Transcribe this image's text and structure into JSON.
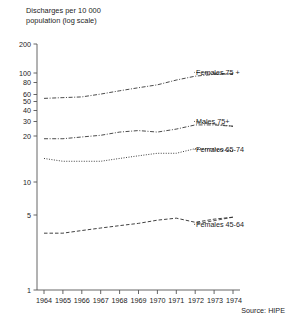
{
  "chart_data": {
    "type": "line",
    "title_line1": "Discharges per 10 000",
    "title_line2": "population (log scale)",
    "xlabel": "",
    "ylabel": "Discharges per 10 000 population (log scale)",
    "yscale": "log",
    "ylim": [
      1,
      200
    ],
    "xlim": [
      1964,
      1974
    ],
    "grid": false,
    "legend_position": "right-inline-labels",
    "source": "Source: HIPE",
    "ytick_labels": [
      "200",
      "100",
      "80",
      "60",
      "50",
      "40",
      "30",
      "20",
      "10",
      "5",
      "1"
    ],
    "ytick_values": [
      200,
      100,
      80,
      60,
      50,
      40,
      30,
      20,
      10,
      5,
      1
    ],
    "categories": [
      "1964",
      "1965",
      "1966",
      "1967",
      "1968",
      "1969",
      "1970",
      "1971",
      "1972",
      "1973",
      "1974"
    ],
    "x": [
      1964,
      1965,
      1966,
      1967,
      1968,
      1969,
      1970,
      1971,
      1972,
      1973,
      1974
    ],
    "series": [
      {
        "name": "Females 75 +",
        "style": "dash-dot",
        "values": [
          62,
          63,
          64,
          68,
          73,
          78,
          83,
          92,
          100,
          104,
          105
        ]
      },
      {
        "name": "Males 75+",
        "style": "dash-dot",
        "values": [
          26,
          26,
          27,
          28,
          30,
          31,
          30,
          32,
          35,
          35,
          34
        ]
      },
      {
        "name": "Females 65-74",
        "style": "dotted",
        "values": [
          17,
          16,
          16,
          16,
          17,
          18,
          19,
          19,
          21,
          21,
          20
        ]
      },
      {
        "name": "Females 45-64",
        "style": "dashed",
        "values": [
          3.4,
          3.4,
          3.6,
          3.8,
          4.0,
          4.2,
          4.5,
          4.7,
          4.3,
          4.6,
          4.8
        ]
      }
    ]
  },
  "labels": {
    "series_0": "Females 75 +",
    "series_1": "Males 75+",
    "series_2": "Females 65-74",
    "series_3": "Females 45-64"
  },
  "ytick": {
    "t0": "200",
    "t1": "100",
    "t2": "80",
    "t3": "60",
    "t4": "50",
    "t5": "40",
    "t6": "30",
    "t7": "20",
    "t8": "10",
    "t9": "5",
    "t10": "1"
  },
  "xtick": {
    "t0": "1964",
    "t1": "1965",
    "t2": "1966",
    "t3": "1967",
    "t4": "1968",
    "t5": "1969",
    "t6": "1970",
    "t7": "1971",
    "t8": "1972",
    "t9": "1973",
    "t10": "1974"
  },
  "colors": {
    "ink": "#1c1c1c",
    "axis": "#555555",
    "line": "#2b2b2b",
    "background": "#ffffff"
  }
}
